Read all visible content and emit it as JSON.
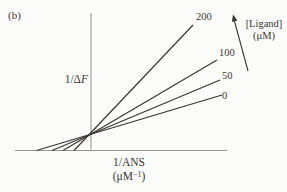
{
  "figure": {
    "panel_label": "(b)",
    "background": "#fcfcfa",
    "ink_color": "#3a3732",
    "axis_color": "#97958f"
  },
  "axes": {
    "y_label_prefix": "1/Δ",
    "y_label_italic": "F",
    "x_label_line1": "1/ANS",
    "x_unit_prefix": "(μM",
    "x_unit_sup": "−1",
    "x_unit_suffix": ")"
  },
  "annotation": {
    "arrow_label_line1": "[Ligand]",
    "arrow_label_line2": "(μM)"
  },
  "chart_data": {
    "type": "line",
    "title": "",
    "panel": "(b)",
    "xlabel": "1/ANS (μM−1)",
    "ylabel": "1/ΔF",
    "legend_label": "[Ligand] (μM)",
    "axis_ticks": "none (schematic sketch, no numeric scale)",
    "grid": false,
    "convergence_point_px": {
      "x": 90.5,
      "y": 134.5
    },
    "series": [
      {
        "name": "0",
        "ligand_uM": 0,
        "px": {
          "x1": 36.5,
          "y1": 150.5,
          "x2": 222,
          "y2": 95,
          "label_x": 222,
          "label_y": 90
        }
      },
      {
        "name": "50",
        "ligand_uM": 50,
        "px": {
          "x1": 52,
          "y1": 150.5,
          "x2": 220,
          "y2": 80,
          "label_x": 222,
          "label_y": 70
        }
      },
      {
        "name": "100",
        "ligand_uM": 100,
        "px": {
          "x1": 63,
          "y1": 150.5,
          "x2": 217,
          "y2": 60,
          "label_x": 219,
          "label_y": 47
        }
      },
      {
        "name": "200",
        "ligand_uM": 200,
        "px": {
          "x1": 74,
          "y1": 150.5,
          "x2": 193,
          "y2": 25,
          "label_x": 196,
          "label_y": 11
        }
      }
    ]
  }
}
